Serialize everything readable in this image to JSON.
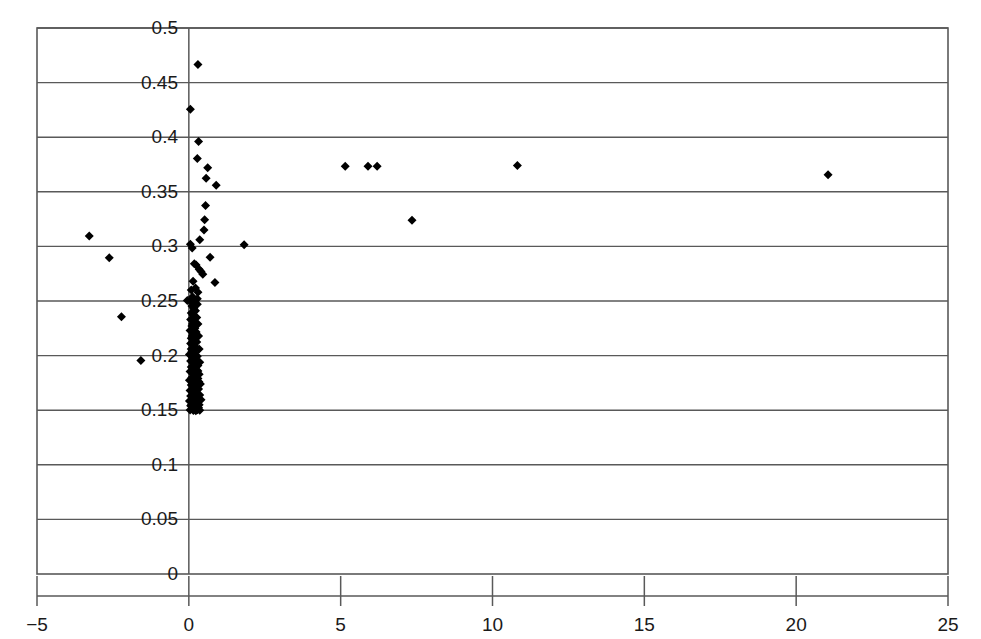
{
  "chart_data": {
    "type": "scatter",
    "title": "",
    "subtitle": "",
    "xlabel": "",
    "ylabel": "",
    "xlim": [
      -5,
      25
    ],
    "ylim": [
      0,
      0.5
    ],
    "xticks": [
      -5,
      0,
      5,
      10,
      15,
      20,
      25
    ],
    "xtick_labels": [
      "−5",
      "0",
      "5",
      "10",
      "15",
      "20",
      "25"
    ],
    "yticks": [
      0,
      0.05,
      0.1,
      0.15,
      0.2,
      0.25,
      0.3,
      0.35,
      0.4,
      0.45,
      0.5
    ],
    "ytick_labels": [
      "0",
      "0.05",
      "0.1",
      "0.15",
      "0.2",
      "0.25",
      "0.3",
      "0.35",
      "0.4",
      "0.45",
      "0.5"
    ],
    "grid": {
      "horizontal": true,
      "vertical": false
    },
    "legend": {
      "visible": false,
      "position": "none"
    },
    "marker": {
      "shape": "diamond",
      "color": "#000000",
      "size": 9
    },
    "axis_line_color": "#595959",
    "frame_color": "#595959",
    "zero_axis_line": {
      "x": 0,
      "visible": true
    },
    "series": [
      {
        "name": "observations",
        "points": [
          [
            0.3,
            0.4665
          ],
          [
            0.05,
            0.4255
          ],
          [
            0.32,
            0.396
          ],
          [
            0.28,
            0.3805
          ],
          [
            0.62,
            0.372
          ],
          [
            0.57,
            0.3625
          ],
          [
            0.9,
            0.356
          ],
          [
            0.55,
            0.3375
          ],
          [
            0.52,
            0.3245
          ],
          [
            0.5,
            0.315
          ],
          [
            0.05,
            0.302
          ],
          [
            0.11,
            0.2985
          ],
          [
            0.36,
            0.306
          ],
          [
            1.82,
            0.3015
          ],
          [
            -3.28,
            0.3095
          ],
          [
            -2.62,
            0.2895
          ],
          [
            0.7,
            0.29
          ],
          [
            0.34,
            0.279
          ],
          [
            0.4,
            0.277
          ],
          [
            0.46,
            0.2745
          ],
          [
            0.18,
            0.284
          ],
          [
            0.24,
            0.283
          ],
          [
            0.86,
            0.267
          ],
          [
            0.14,
            0.268
          ],
          [
            0.22,
            0.262
          ],
          [
            0.08,
            0.26
          ],
          [
            0.3,
            0.258
          ],
          [
            0.12,
            0.254
          ],
          [
            0.05,
            0.25
          ],
          [
            0.2,
            0.249
          ],
          [
            0.28,
            0.252
          ],
          [
            -0.05,
            0.2505
          ],
          [
            -2.22,
            0.2355
          ],
          [
            -1.58,
            0.1955
          ],
          [
            0.1,
            0.2455
          ],
          [
            0.16,
            0.243
          ],
          [
            0.22,
            0.241
          ],
          [
            0.08,
            0.239
          ],
          [
            0.14,
            0.237
          ],
          [
            0.26,
            0.235
          ],
          [
            0.06,
            0.233
          ],
          [
            0.18,
            0.231
          ],
          [
            0.3,
            0.229
          ],
          [
            0.1,
            0.227
          ],
          [
            0.2,
            0.225
          ],
          [
            0.04,
            0.223
          ],
          [
            0.24,
            0.2215
          ],
          [
            0.14,
            0.2195
          ],
          [
            0.32,
            0.218
          ],
          [
            0.08,
            0.216
          ],
          [
            0.18,
            0.2145
          ],
          [
            0.26,
            0.2125
          ],
          [
            0.06,
            0.211
          ],
          [
            0.16,
            0.209
          ],
          [
            0.22,
            0.2075
          ],
          [
            0.34,
            0.206
          ],
          [
            0.1,
            0.204
          ],
          [
            0.2,
            0.2025
          ],
          [
            0.02,
            0.201
          ],
          [
            0.28,
            0.1995
          ],
          [
            0.12,
            0.198
          ],
          [
            0.24,
            0.1965
          ],
          [
            0.06,
            0.195
          ],
          [
            0.36,
            0.194
          ],
          [
            0.16,
            0.1925
          ],
          [
            0.3,
            0.191
          ],
          [
            0.08,
            0.1895
          ],
          [
            0.2,
            0.188
          ],
          [
            0.26,
            0.1865
          ],
          [
            0.04,
            0.1855
          ],
          [
            0.14,
            0.184
          ],
          [
            0.34,
            0.183
          ],
          [
            0.22,
            0.1815
          ],
          [
            0.1,
            0.18
          ],
          [
            0.3,
            0.179
          ],
          [
            0.02,
            0.1775
          ],
          [
            0.18,
            0.1765
          ],
          [
            0.26,
            0.175
          ],
          [
            0.38,
            0.174
          ],
          [
            0.08,
            0.173
          ],
          [
            0.16,
            0.1715
          ],
          [
            0.24,
            0.1705
          ],
          [
            0.32,
            0.1695
          ],
          [
            0.04,
            0.168
          ],
          [
            0.12,
            0.167
          ],
          [
            0.2,
            0.166
          ],
          [
            0.28,
            0.165
          ],
          [
            0.36,
            0.164
          ],
          [
            0.06,
            0.163
          ],
          [
            0.14,
            0.162
          ],
          [
            0.22,
            0.161
          ],
          [
            0.3,
            0.16
          ],
          [
            0.4,
            0.1595
          ],
          [
            0.02,
            0.1585
          ],
          [
            0.1,
            0.1575
          ],
          [
            0.18,
            0.1565
          ],
          [
            0.26,
            0.1558
          ],
          [
            0.34,
            0.155
          ],
          [
            0.06,
            0.154
          ],
          [
            0.16,
            0.1535
          ],
          [
            0.24,
            0.1528
          ],
          [
            0.32,
            0.1522
          ],
          [
            0.12,
            0.1515
          ],
          [
            0.2,
            0.151
          ],
          [
            0.28,
            0.1505
          ],
          [
            0.04,
            0.1502
          ],
          [
            0.36,
            0.15
          ],
          [
            0.15,
            0.1498
          ],
          [
            0.23,
            0.1495
          ],
          [
            0.08,
            0.206
          ],
          [
            0.12,
            0.229
          ],
          [
            0.28,
            0.247
          ],
          [
            0.18,
            0.198
          ],
          [
            0.22,
            0.17
          ],
          [
            0.3,
            0.186
          ],
          [
            0.11,
            0.218
          ],
          [
            0.25,
            0.162
          ],
          [
            0.33,
            0.176
          ],
          [
            0.09,
            0.155
          ],
          [
            5.15,
            0.3735
          ],
          [
            5.9,
            0.3735
          ],
          [
            6.2,
            0.3735
          ],
          [
            10.82,
            0.374
          ],
          [
            21.05,
            0.3655
          ],
          [
            7.35,
            0.324
          ]
        ]
      }
    ]
  },
  "plot_geometry": {
    "left_px": 37,
    "right_px": 948,
    "top_px": 28,
    "bottom_px": 574
  }
}
